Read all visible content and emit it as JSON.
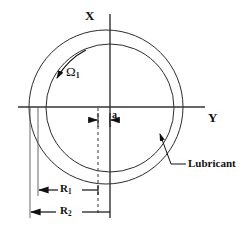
{
  "figure": {
    "kind": "journal-bearing-cross-section-diagram",
    "background_color": "#ffffff",
    "line_color": "#1a1a1a"
  },
  "axes": {
    "x_label": "X",
    "y_label": "Y",
    "origin_x": 110,
    "origin_y": 107,
    "vertical_line": {
      "x": 110,
      "y_top": 14,
      "y_bottom": 218
    },
    "horizontal_line": {
      "y": 107,
      "x_left": 18,
      "x_right": 205
    }
  },
  "circles": [
    {
      "name": "outer-circle-bearing",
      "label_ref": "R2",
      "cx": 106,
      "cy": 107,
      "r": 77,
      "stroke": "#2b2b2b",
      "stroke_width": 1
    },
    {
      "name": "inner-circle-journal",
      "label_ref": "R1",
      "cx": 110,
      "cy": 108,
      "r": 64,
      "stroke": "#2b2b2b",
      "stroke_width": 1
    }
  ],
  "annotations": {
    "omega": {
      "text": "Ω",
      "subscript": "1",
      "rotation_sense": "counter-clockwise"
    },
    "eccentricity": {
      "text": "a",
      "from_x": 98,
      "to_x": 110,
      "y": 121
    },
    "radius_inner": {
      "text": "R",
      "subscript": "1",
      "from_x": 38,
      "to_x": 98,
      "y": 190
    },
    "radius_outer": {
      "text": "R",
      "subscript": "2",
      "from_x": 30,
      "to_x": 110,
      "y": 212
    },
    "lubricant": {
      "text": "Lubricant",
      "leader_from_x": 186,
      "leader_from_y": 164,
      "leader_to_x": 160,
      "leader_to_y": 133
    }
  },
  "dashed_line": {
    "x": 98,
    "y_top": 108,
    "y_bottom": 214,
    "dash": "3,3"
  }
}
